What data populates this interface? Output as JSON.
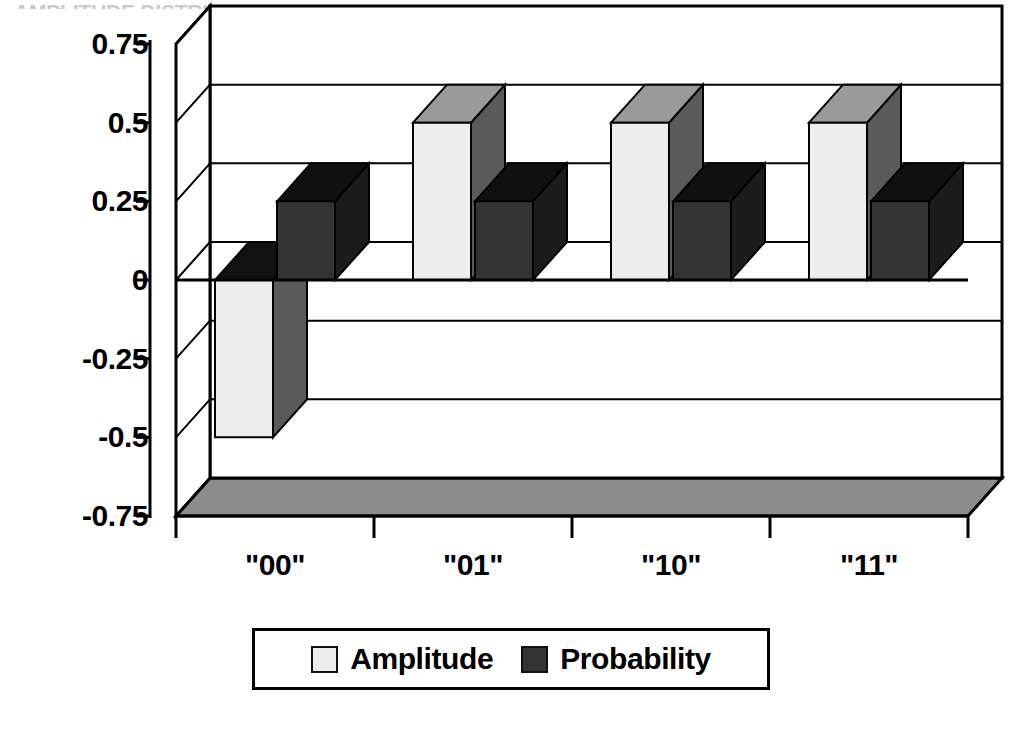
{
  "chart_title": "AMPLITUDE DISTRIBUTION",
  "chart_data": {
    "type": "bar",
    "title": "AMPLITUDE DISTRIBUTION",
    "xlabel": "",
    "ylabel": "",
    "categories": [
      "\"00\"",
      "\"01\"",
      "\"10\"",
      "\"11\""
    ],
    "series": [
      {
        "name": "Amplitude",
        "values": [
          -0.5,
          0.5,
          0.5,
          0.5
        ],
        "color": "#EDEDED"
      },
      {
        "name": "Probability",
        "values": [
          0.25,
          0.25,
          0.25,
          0.25
        ],
        "color": "#333333"
      }
    ],
    "ylim": [
      -0.75,
      0.75
    ],
    "yticks": [
      "0.75",
      "0.5",
      "0.25",
      "0",
      "-0.25",
      "-0.5",
      "-0.75"
    ],
    "ytick_values": [
      0.75,
      0.5,
      0.25,
      0,
      -0.25,
      -0.5,
      -0.75
    ],
    "grid": true,
    "grid_axis": "y",
    "legend_position": "bottom",
    "three_d": true
  },
  "colors": {
    "amplitude_front": "#EDEDED",
    "amplitude_side": "#5A5A5A",
    "amplitude_top": "#9A9A9A",
    "probability_front": "#333333",
    "probability_side": "#1C1C1C",
    "probability_top": "#101010",
    "floor": "#8C8C8C",
    "axis": "#000000",
    "grid": "#000000",
    "background": "#FFFFFF"
  },
  "legend": {
    "entries": [
      {
        "label": "Amplitude",
        "swatch": "#EDEDED"
      },
      {
        "label": "Probability",
        "swatch": "#333333"
      }
    ]
  }
}
